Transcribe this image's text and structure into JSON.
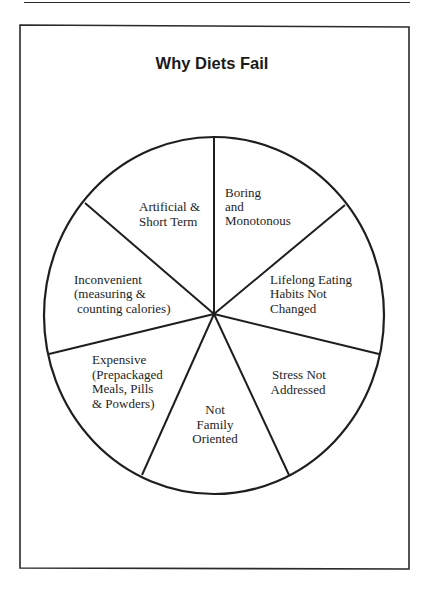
{
  "figure": {
    "title": "Why Diets Fail",
    "segments": [
      {
        "id": "boring",
        "lines": [
          "Boring",
          "and",
          "Monotonous"
        ]
      },
      {
        "id": "lifelong",
        "lines": [
          "Lifelong Eating",
          "Habits Not",
          "Changed"
        ]
      },
      {
        "id": "stress",
        "lines": [
          "Stress Not",
          "Addressed"
        ]
      },
      {
        "id": "family",
        "lines": [
          "Not",
          "Family",
          "Oriented"
        ]
      },
      {
        "id": "expensive",
        "lines": [
          "Expensive",
          "(Prepackaged",
          "Meals, Pills",
          "& Powders)"
        ]
      },
      {
        "id": "inconvenient",
        "lines": [
          "Inconvenient",
          "(measuring &",
          "counting calories)"
        ]
      },
      {
        "id": "artificial",
        "lines": [
          "Artificial &",
          "Short Term"
        ]
      }
    ]
  },
  "colors": {
    "ink": "#1e1e1e",
    "background": "#ffffff"
  }
}
